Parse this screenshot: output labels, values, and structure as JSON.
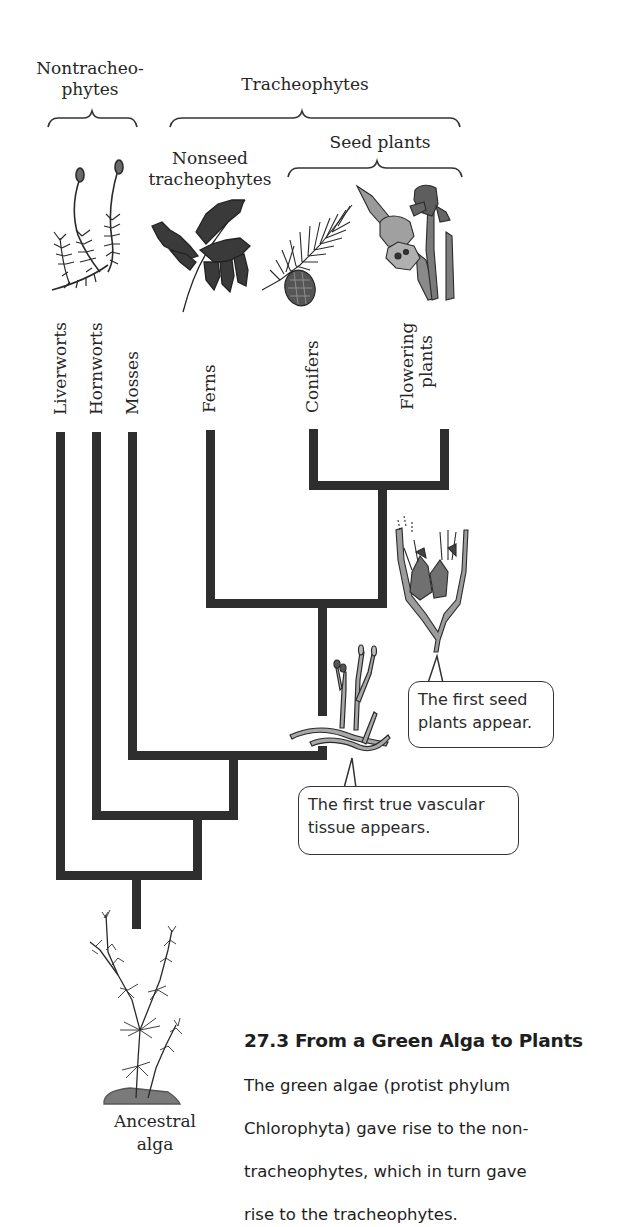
{
  "groups": {
    "nontracheophytes": "Nontracheo-\nphytes",
    "nontracheophytes_line1": "Nontracheo-",
    "nontracheophytes_line2": "phytes",
    "tracheophytes": "Tracheophytes",
    "nonseed_line1": "Nonseed",
    "nonseed_line2": "tracheophytes",
    "seed_plants": "Seed plants"
  },
  "taxa": [
    {
      "label": "Liverworts",
      "illustration": "liverwort-moss-icon"
    },
    {
      "label": "Hornworts"
    },
    {
      "label": "Mosses",
      "illustration": "moss-icon"
    },
    {
      "label": "Ferns",
      "illustration": "fern-icon"
    },
    {
      "label": "Conifers",
      "illustration": "conifer-icon"
    },
    {
      "label_line1": "Flowering",
      "label_line2": "plants",
      "illustration": "iris-flower-icon"
    }
  ],
  "callouts": {
    "seed_plants": {
      "line1": "The first seed",
      "line2": "plants appear."
    },
    "vascular": {
      "line1": "The first true vascular",
      "line2": "tissue appears."
    }
  },
  "root": {
    "line1": "Ancestral",
    "line2": "alga"
  },
  "caption": {
    "title": "27.3  From a Green Alga to Plants",
    "line1": "The green algae (protist phylum",
    "line2": "Chlorophyta) gave rise to the non-",
    "line3": "tracheophytes, which in turn gave",
    "line4": "rise to the tracheophytes."
  },
  "colors": {
    "branch": "#2e2e2e",
    "ink": "#262626",
    "illustration_fill": "#8a8a8a",
    "illustration_dark": "#3a3a3a"
  }
}
